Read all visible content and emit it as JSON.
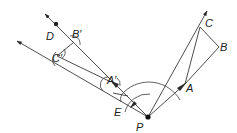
{
  "diagram": {
    "type": "geometric-construction",
    "colors": {
      "stroke": "#3a3a3a",
      "label": "#222222",
      "background": "#ffffff"
    },
    "points": {
      "P": {
        "label": "P",
        "x": 148,
        "y": 117
      },
      "A": {
        "label": "A",
        "x": 185,
        "y": 84
      },
      "B": {
        "label": "B",
        "x": 219,
        "y": 47
      },
      "C": {
        "label": "C",
        "x": 200,
        "y": 27
      },
      "A_prime": {
        "label": "A′",
        "x": 111,
        "y": 82
      },
      "B_prime": {
        "label": "B′",
        "x": 74,
        "y": 42
      },
      "C_prime": {
        "label": "C′",
        "x": 57,
        "y": 56
      },
      "D": {
        "label": "D",
        "x": 56,
        "y": 24
      },
      "E": {
        "label": "E",
        "x": 128,
        "y": 100
      }
    },
    "labels": [
      "A",
      "B",
      "C",
      "A′",
      "B′",
      "C′",
      "D",
      "E",
      "P"
    ]
  }
}
